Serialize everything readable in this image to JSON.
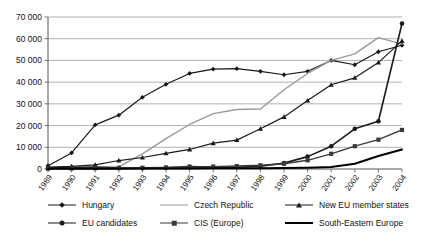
{
  "chart_data": {
    "type": "line",
    "title": "",
    "xlabel": "",
    "ylabel": "",
    "grid": true,
    "legend_position": "bottom",
    "ylim": [
      0,
      70000
    ],
    "ytick_step": 10000,
    "ytick_labels": [
      "0",
      "10 000",
      "20 000",
      "30 000",
      "40 000",
      "50 000",
      "60 000",
      "70 000"
    ],
    "ytick_values": [
      0,
      10000,
      20000,
      30000,
      40000,
      50000,
      60000,
      70000
    ],
    "categories": [
      "1989",
      "1990",
      "1991",
      "1992",
      "1993",
      "1994",
      "1995",
      "1996",
      "1997",
      "1998",
      "1999",
      "2000",
      "2001",
      "2002",
      "2003",
      "2004"
    ],
    "series": [
      {
        "name": "Hungary",
        "marker": "diamond",
        "color": "#1a1a1a",
        "width": 1.2,
        "values": [
          1500,
          7400,
          20300,
          24800,
          33000,
          39000,
          44000,
          46000,
          46200,
          45000,
          43400,
          45000,
          50000,
          48000,
          54000,
          57000
        ]
      },
      {
        "name": "Czech Republic",
        "marker": "none",
        "color": "#9a9a9a",
        "width": 1.4,
        "values": [
          200,
          400,
          600,
          1000,
          7000,
          14000,
          20500,
          25500,
          27400,
          27600,
          36500,
          44000,
          50000,
          53000,
          60500,
          57500
        ]
      },
      {
        "name": "New EU member states",
        "marker": "triangle",
        "color": "#1a1a1a",
        "width": 1.2,
        "values": [
          900,
          1200,
          1900,
          3900,
          5300,
          7200,
          9000,
          11900,
          13300,
          18500,
          24000,
          31500,
          38800,
          42000,
          49000,
          59000
        ]
      },
      {
        "name": "EU candidates",
        "marker": "circle",
        "color": "#1a1a1a",
        "width": 1.6,
        "values": [
          400,
          700,
          900,
          500,
          400,
          600,
          1100,
          900,
          800,
          1300,
          2700,
          5700,
          10500,
          18500,
          22000,
          67000
        ]
      },
      {
        "name": "CIS (Europe)",
        "marker": "square",
        "color": "#3a3a3a",
        "width": 1.4,
        "values": [
          150,
          250,
          350,
          450,
          550,
          700,
          900,
          1100,
          1350,
          1700,
          2400,
          4000,
          7000,
          10500,
          13500,
          18000
        ]
      },
      {
        "name": "South-Eastern Europe",
        "marker": "none",
        "color": "#000000",
        "width": 2,
        "values": [
          60,
          90,
          120,
          150,
          180,
          220,
          260,
          300,
          340,
          380,
          450,
          600,
          900,
          2400,
          6000,
          9000
        ]
      }
    ]
  },
  "legend": {
    "items": [
      {
        "label": "Hungary",
        "marker": "diamond",
        "color": "#1a1a1a",
        "width": 1.2
      },
      {
        "label": "Czech Republic",
        "marker": "none",
        "color": "#9a9a9a",
        "width": 1.6
      },
      {
        "label": "New EU member states",
        "marker": "triangle",
        "color": "#1a1a1a",
        "width": 1.2
      },
      {
        "label": "EU candidates",
        "marker": "circle",
        "color": "#1a1a1a",
        "width": 1.8
      },
      {
        "label": "CIS (Europe)",
        "marker": "square",
        "color": "#3a3a3a",
        "width": 1.4
      },
      {
        "label": "South-Eastern Europe",
        "marker": "none",
        "color": "#000000",
        "width": 2.2
      }
    ]
  },
  "axes": {
    "plot_left": 48,
    "plot_right": 402,
    "plot_top": 17,
    "plot_bottom": 169,
    "axis_color": "#555555",
    "grid_color": "#8f8f8f"
  }
}
